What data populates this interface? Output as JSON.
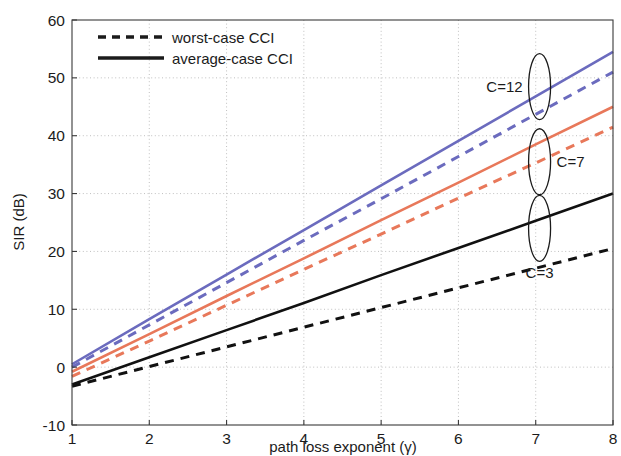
{
  "chart_data": {
    "type": "line",
    "title": "",
    "subtitle": "",
    "xlabel": "path loss exponent (γ)",
    "ylabel": "SIR (dB)",
    "xlim": [
      1,
      8
    ],
    "ylim": [
      -10,
      60
    ],
    "xticks": [
      1,
      2,
      3,
      4,
      5,
      6,
      7,
      8
    ],
    "xticklabels": [
      "1",
      "2",
      "3",
      "4",
      "5",
      "6",
      "7",
      "8"
    ],
    "yticks": [
      -10,
      0,
      10,
      20,
      30,
      40,
      50,
      60
    ],
    "yticklabels": [
      "-10",
      "0",
      "10",
      "20",
      "30",
      "40",
      "50",
      "60"
    ],
    "grid": true,
    "grid_style": "dotted",
    "legend": {
      "position": "top-left",
      "entries": [
        {
          "label": "worst-case CCI",
          "style": "dashed",
          "color": "#1b1b1b"
        },
        {
          "label": "average-case CCI",
          "style": "solid",
          "color": "#1b1b1b"
        }
      ]
    },
    "series": [
      {
        "name": "C=12 average-case CCI",
        "cluster": "C=12",
        "style": "solid",
        "color": "#6b6bbe",
        "x": [
          1,
          2,
          3,
          4,
          5,
          6,
          7,
          8
        ],
        "y": [
          0.5,
          8.3,
          16.0,
          23.7,
          31.4,
          39.1,
          46.8,
          54.5
        ]
      },
      {
        "name": "C=12 worst-case CCI",
        "cluster": "C=12",
        "style": "dashed",
        "color": "#6b6bbe",
        "x": [
          1,
          2,
          3,
          4,
          5,
          6,
          7,
          8
        ],
        "y": [
          0.0,
          7.3,
          14.6,
          21.9,
          29.1,
          36.4,
          43.7,
          51.0
        ]
      },
      {
        "name": "C=7 average-case CCI",
        "cluster": "C=7",
        "style": "solid",
        "color": "#e8785a",
        "x": [
          1,
          2,
          3,
          4,
          5,
          6,
          7,
          8
        ],
        "y": [
          -0.8,
          5.7,
          12.3,
          18.8,
          25.4,
          31.9,
          38.5,
          45.0
        ]
      },
      {
        "name": "C=7 worst-case CCI",
        "cluster": "C=7",
        "style": "dashed",
        "color": "#e8785a",
        "x": [
          1,
          2,
          3,
          4,
          5,
          6,
          7,
          8
        ],
        "y": [
          -1.6,
          4.5,
          10.7,
          16.9,
          23.0,
          29.2,
          35.3,
          41.5
        ]
      },
      {
        "name": "C=3 average-case CCI",
        "cluster": "C=3",
        "style": "solid",
        "color": "#111111",
        "x": [
          1,
          2,
          3,
          4,
          5,
          6,
          7,
          8
        ],
        "y": [
          -3.0,
          1.7,
          6.4,
          11.1,
          15.9,
          20.6,
          25.3,
          30.0
        ]
      },
      {
        "name": "C=3 worst-case CCI",
        "cluster": "C=3",
        "style": "dashed",
        "color": "#111111",
        "x": [
          1,
          2,
          3,
          4,
          5,
          6,
          7,
          8
        ],
        "y": [
          -3.3,
          0.1,
          3.5,
          6.9,
          10.3,
          13.7,
          17.1,
          20.5
        ]
      }
    ],
    "annotations": [
      {
        "text": "C=12",
        "x": 7.05,
        "y": 48.5,
        "marker": "ellipse",
        "label_side": "left"
      },
      {
        "text": "C=7",
        "x": 7.05,
        "y": 35.5,
        "marker": "ellipse",
        "label_side": "right"
      },
      {
        "text": "C=3",
        "x": 7.05,
        "y": 24.0,
        "marker": "ellipse",
        "label_side": "below"
      }
    ]
  }
}
